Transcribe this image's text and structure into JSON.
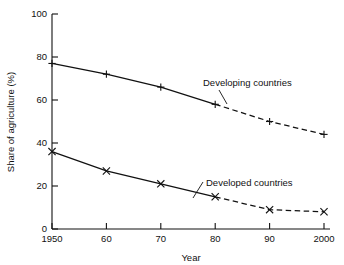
{
  "chart_data": {
    "type": "line",
    "title": "",
    "xlabel": "Year",
    "ylabel": "Share of agriculture (%)",
    "x": [
      1950,
      1960,
      1970,
      1980,
      1990,
      2000
    ],
    "xtick_labels": [
      "1950",
      "60",
      "70",
      "80",
      "90",
      "2000"
    ],
    "ytick_labels": [
      "0",
      "20",
      "40",
      "60",
      "80",
      "100"
    ],
    "ytick_values": [
      0,
      20,
      40,
      60,
      80,
      100
    ],
    "xlim": [
      1950,
      2000
    ],
    "ylim": [
      0,
      100
    ],
    "grid": false,
    "legend_position": "inline-annotation",
    "projection_starts_at": 1980,
    "series": [
      {
        "name": "Developing countries",
        "marker": "plus",
        "values": [
          77,
          72,
          66,
          58,
          50,
          44
        ],
        "solid_until": 1980,
        "dashed_from": 1980
      },
      {
        "name": "Developed countries",
        "marker": "cross",
        "values": [
          36,
          27,
          21,
          15,
          9,
          8
        ],
        "solid_until": 1980,
        "dashed_from": 1980
      }
    ],
    "annotations": [
      {
        "text": "Developing countries",
        "attaches_to": "Developing countries"
      },
      {
        "text": "Developed countries",
        "attaches_to": "Developed countries"
      }
    ]
  },
  "colors": {
    "ink": "#111111",
    "background": "#ffffff"
  }
}
